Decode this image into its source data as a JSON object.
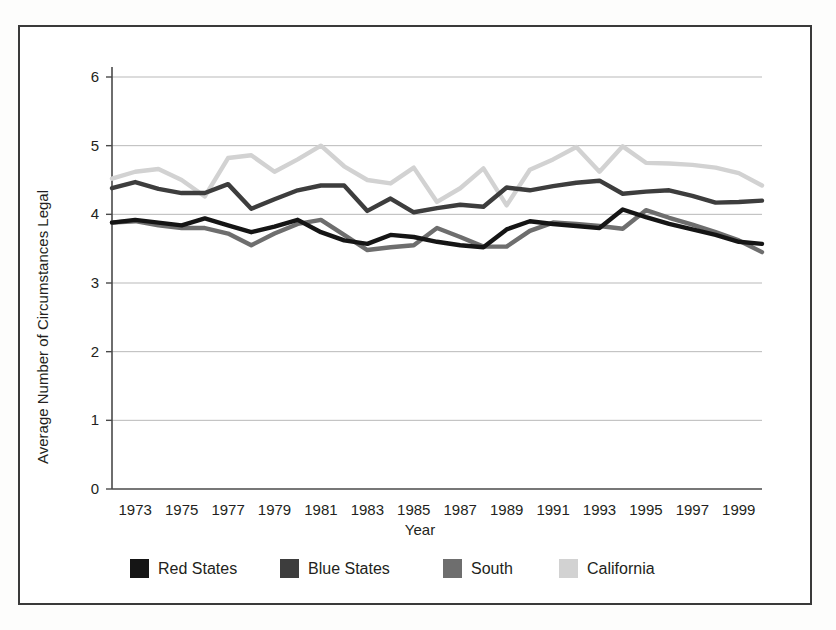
{
  "figure": {
    "background_color": "#ffffff",
    "frame_color": "#3a3a3a"
  },
  "chart_data": {
    "type": "line",
    "title": "",
    "xlabel": "Year",
    "ylabel": "Average Number of Circumstances Legal",
    "xlim": [
      1972,
      2000
    ],
    "ylim": [
      0,
      6
    ],
    "ytick_labels": [
      "0",
      "1",
      "2",
      "3",
      "4",
      "5",
      "6"
    ],
    "yticks": [
      0,
      1,
      2,
      3,
      4,
      5,
      6
    ],
    "xtick_labels": [
      "1973",
      "1975",
      "1977",
      "1979",
      "1981",
      "1983",
      "1985",
      "1987",
      "1989",
      "1991",
      "1993",
      "1995",
      "1997",
      "1999"
    ],
    "xticks": [
      1973,
      1975,
      1977,
      1979,
      1981,
      1983,
      1985,
      1987,
      1989,
      1991,
      1993,
      1995,
      1997,
      1999
    ],
    "grid": "horizontal",
    "legend_position": "bottom",
    "x": [
      1972,
      1973,
      1974,
      1975,
      1976,
      1977,
      1978,
      1979,
      1980,
      1981,
      1982,
      1983,
      1984,
      1985,
      1986,
      1987,
      1988,
      1989,
      1990,
      1991,
      1992,
      1993,
      1994,
      1995,
      1996,
      1997,
      1998,
      1999,
      2000
    ],
    "series": [
      {
        "name": "Red States",
        "color": "#151515",
        "values": [
          3.88,
          3.92,
          3.88,
          3.84,
          3.94,
          3.84,
          3.74,
          3.82,
          3.92,
          3.74,
          3.62,
          3.57,
          3.7,
          3.67,
          3.6,
          3.55,
          3.52,
          3.78,
          3.9,
          3.86,
          3.83,
          3.8,
          4.07,
          3.96,
          3.86,
          3.78,
          3.7,
          3.6,
          3.57
        ]
      },
      {
        "name": "Blue States",
        "color": "#3d3d3d",
        "values": [
          4.38,
          4.47,
          4.37,
          4.31,
          4.31,
          4.44,
          4.08,
          4.22,
          4.35,
          4.42,
          4.42,
          4.05,
          4.23,
          4.03,
          4.09,
          4.14,
          4.11,
          4.39,
          4.35,
          4.41,
          4.46,
          4.49,
          4.3,
          4.33,
          4.35,
          4.27,
          4.17,
          4.18,
          4.2
        ]
      },
      {
        "name": "South",
        "color": "#6e6e6e",
        "values": [
          3.88,
          3.9,
          3.84,
          3.8,
          3.8,
          3.72,
          3.55,
          3.72,
          3.86,
          3.92,
          3.7,
          3.48,
          3.52,
          3.55,
          3.8,
          3.67,
          3.53,
          3.53,
          3.76,
          3.88,
          3.86,
          3.83,
          3.79,
          4.06,
          3.95,
          3.85,
          3.74,
          3.62,
          3.45
        ]
      },
      {
        "name": "California",
        "color": "#d2d2d2",
        "values": [
          4.52,
          4.62,
          4.66,
          4.5,
          4.26,
          4.82,
          4.86,
          4.62,
          4.8,
          5.0,
          4.7,
          4.5,
          4.45,
          4.68,
          4.18,
          4.38,
          4.67,
          4.13,
          4.65,
          4.8,
          4.98,
          4.62,
          4.99,
          4.75,
          4.74,
          4.72,
          4.68,
          4.6,
          4.42
        ]
      }
    ]
  },
  "legend": {
    "items": [
      {
        "label": "Red States",
        "color": "#151515"
      },
      {
        "label": "Blue States",
        "color": "#3d3d3d"
      },
      {
        "label": "South",
        "color": "#6e6e6e"
      },
      {
        "label": "California",
        "color": "#d2d2d2"
      }
    ]
  }
}
